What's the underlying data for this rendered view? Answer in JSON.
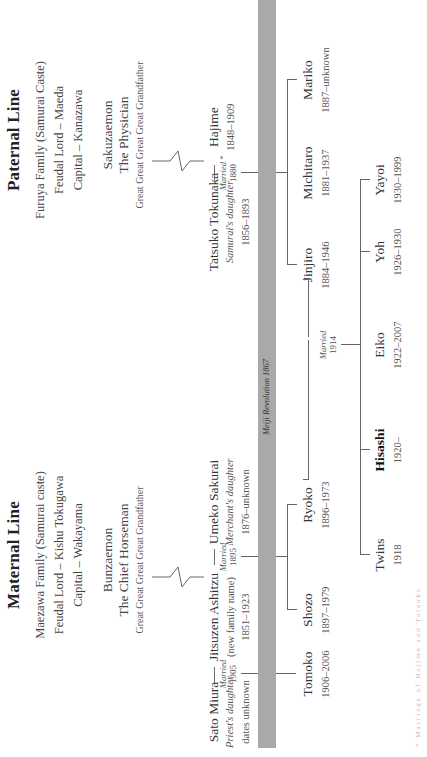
{
  "paternal": {
    "title": "Paternal Line",
    "family": "Furuya Family (Samurai Caste)",
    "lord": "Feudal Lord – Maeda",
    "capital": "Capital – Kanazawa",
    "ancestor": {
      "name": "Sakuzaemon",
      "role": "The Physician",
      "relation": "Great Great Great Great Grandfather"
    },
    "couple": {
      "wife": {
        "name": "Tatsuko Tokunaka",
        "desc": "Samurai's daughter",
        "dates": "1856–1893"
      },
      "married_label": "Married *",
      "married_year": "1880",
      "husband": {
        "name": "Hajime",
        "dates": "1848–1909"
      }
    },
    "children": [
      {
        "name": "Jinjiro",
        "dates": "1884–1946"
      },
      {
        "name": "Michitaro",
        "dates": "1881–1937"
      },
      {
        "name": "Mariko",
        "dates": "1887–unknown"
      }
    ]
  },
  "maternal": {
    "title": "Maternal Line",
    "family": "Maezawa Family (Samurai caste)",
    "lord": "Feudal Lord – Kishu Tokugawa",
    "capital": "Capital – Wakayama",
    "ancestor": {
      "name": "Bunzaemon",
      "role": "The Chief Horseman",
      "relation": "Great Great Great Great Grandfather"
    },
    "first_wife": {
      "name": "Sato Miura",
      "desc": "Priest's daughter",
      "dates": "dates unknown"
    },
    "married1_label": "Married",
    "married1_year": "1905",
    "husband": {
      "name": "Jitsuzen Ashitzu",
      "desc": "(new family name)",
      "dates": "1851–1923"
    },
    "married2_label": "Married",
    "married2_year": "1895",
    "second_wife": {
      "name": "Umeko Sakurai",
      "desc": "Merchant's daughter",
      "dates": "1876–unknown"
    },
    "children_first": [
      {
        "name": "Tomoko",
        "dates": "1906–2006"
      }
    ],
    "children_second": [
      {
        "name": "Shozo",
        "dates": "1897–1979"
      },
      {
        "name": "Ryoko",
        "dates": "1896–1973"
      }
    ]
  },
  "timeline_bar": {
    "label": "Meiji Revolution 1867",
    "color": "#a9a9a9"
  },
  "union": {
    "married_label": "Married",
    "married_year": "1914"
  },
  "grandchildren": [
    {
      "name": "Twins",
      "dates": "1918",
      "bold": false
    },
    {
      "name": "Hisashi",
      "dates": "1920–",
      "bold": true
    },
    {
      "name": "Eiko",
      "dates": "1922–2007",
      "bold": false
    },
    {
      "name": "Yoh",
      "dates": "1926–1930",
      "bold": false
    },
    {
      "name": "Yayoi",
      "dates": "1930–1999",
      "bold": false
    }
  ],
  "footnote": "* Marriage of Hajime and Tatsuko"
}
